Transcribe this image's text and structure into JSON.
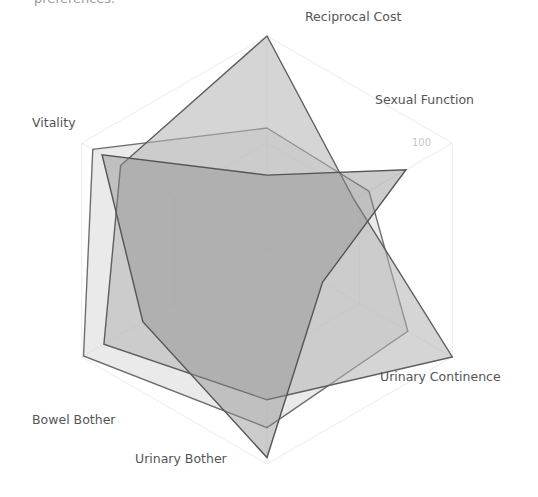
{
  "caption": "preferences.",
  "chart_data": {
    "type": "radar",
    "title": "",
    "axes": [
      "Reciprocal Cost",
      "Sexual Function",
      "Urinary Continence",
      "Urinary Bother",
      "Bowel Bother",
      "Vitality"
    ],
    "range": [
      0,
      100
    ],
    "tick_labels": [
      "0",
      "100"
    ],
    "series": [
      {
        "name": "Series A",
        "values": [
          57,
          55,
          76,
          83,
          99,
          94
        ],
        "fill": "#d9d9d9",
        "stroke": "#6e6e6e",
        "opacity": 0.55
      },
      {
        "name": "Series B",
        "values": [
          100,
          47,
          100,
          70,
          88,
          79
        ],
        "fill": "#b3b3b3",
        "stroke": "#5e5e5e",
        "opacity": 0.55
      },
      {
        "name": "Series C",
        "values": [
          35,
          75,
          30,
          97,
          67,
          89
        ],
        "fill": "#8f8f8f",
        "stroke": "#555555",
        "opacity": 0.45
      }
    ],
    "grid": true,
    "legend": "none"
  }
}
